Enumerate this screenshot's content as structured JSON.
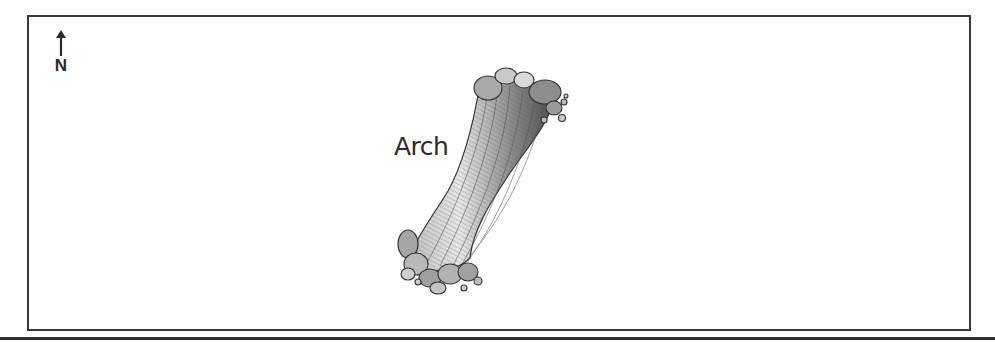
{
  "map": {
    "north_arrow": {
      "icon": "north-arrow-icon",
      "label": "N"
    },
    "features": [
      {
        "label": "Arch",
        "icon": "rock-arch-illustration"
      }
    ]
  },
  "colors": {
    "frame": "#3a3a3a",
    "text": "#2c2c2c",
    "background": "#ffffff"
  }
}
